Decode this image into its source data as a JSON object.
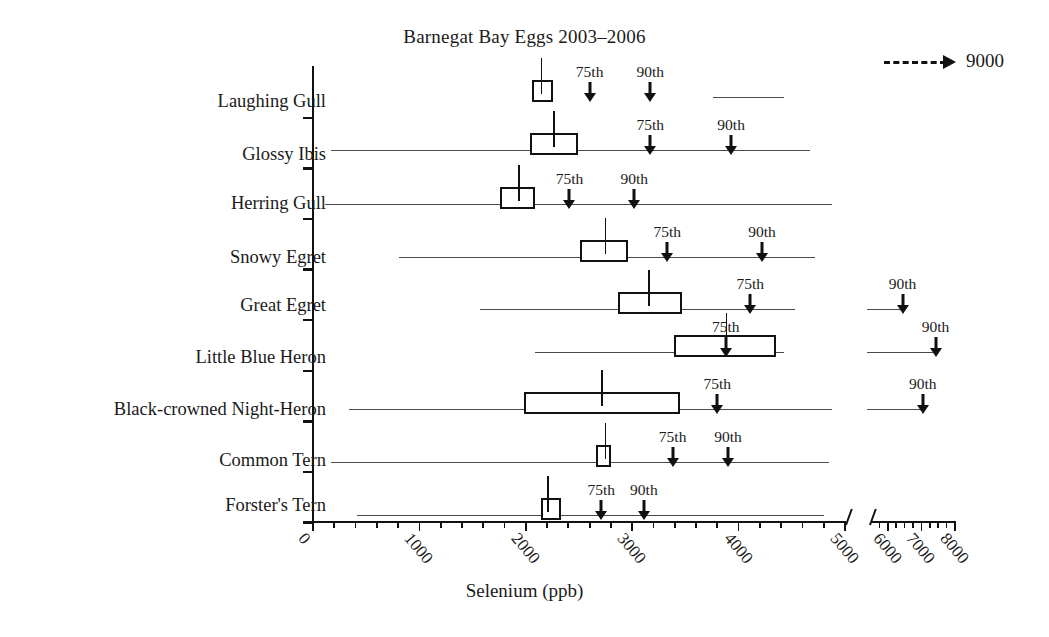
{
  "chart_data": {
    "type": "box",
    "title": "Barnegat Bay Eggs 2003–2006",
    "xlabel": "Selenium (ppb)",
    "ylabel": "",
    "grid": false,
    "axis_break": {
      "present": true,
      "after": 5000,
      "before": 5500
    },
    "xlim": [
      0,
      8000
    ],
    "xticks": [
      0,
      1000,
      2000,
      3000,
      4000,
      5000,
      6000,
      7000,
      8000
    ],
    "xticklabels": [
      "0",
      "1000",
      "2000",
      "3000",
      "4000",
      "5000",
      "6000",
      "7000",
      "8000"
    ],
    "legend": {
      "position": "top-right",
      "label": "9000",
      "marker": "dashed-arrow"
    },
    "categories": [
      "Laughing Gull",
      "Glossy Ibis",
      "Herring Gull",
      "Snowy Egret",
      "Great Egret",
      "Little Blue Heron",
      "Black-crowned Night-Heron",
      "Common Tern",
      "Forster's Tern"
    ],
    "marker_labels": {
      "p75": "75th",
      "p90": "90th"
    },
    "series": [
      {
        "name": "Laughing Gull",
        "range_min": 3760,
        "range_max": 4430,
        "box_low": 2060,
        "box_high": 2260,
        "median": 2140,
        "p75": 2600,
        "p90": 3170
      },
      {
        "name": "Glossy Ibis",
        "range_min": 170,
        "range_max": 4670,
        "box_low": 2040,
        "box_high": 2490,
        "median": 2260,
        "p75": 3170,
        "p90": 3930
      },
      {
        "name": "Herring Gull",
        "range_min": 110,
        "range_max": 4880,
        "box_low": 1760,
        "box_high": 2090,
        "median": 1930,
        "p75": 2410,
        "p90": 3020
      },
      {
        "name": "Snowy Egret",
        "range_min": 810,
        "range_max": 4720,
        "box_low": 2510,
        "box_high": 2960,
        "median": 2740,
        "p75": 3330,
        "p90": 4220
      },
      {
        "name": "Great Egret",
        "range_min": 1570,
        "range_max": 4530,
        "box_low": 2870,
        "box_high": 3470,
        "median": 3150,
        "p75": 4110,
        "p90": 6440
      },
      {
        "name": "Little Blue Heron",
        "range_min": 2090,
        "range_max": 4430,
        "box_low": 3390,
        "box_high": 4350,
        "median": 3880,
        "p75": 3880,
        "p90": 7420
      },
      {
        "name": "Black-crowned Night-Heron",
        "range_min": 340,
        "range_max": 4880,
        "box_low": 1980,
        "box_high": 3450,
        "median": 2710,
        "p75": 3800,
        "p90": 7040
      },
      {
        "name": "Common Tern",
        "range_min": 170,
        "range_max": 4850,
        "box_low": 2660,
        "box_high": 2800,
        "median": 2740,
        "p75": 3380,
        "p90": 3900
      },
      {
        "name": "Forster's Tern",
        "range_min": 410,
        "range_max": 4800,
        "box_low": 2140,
        "box_high": 2330,
        "median": 2200,
        "p75": 2710,
        "p90": 3110
      }
    ]
  }
}
